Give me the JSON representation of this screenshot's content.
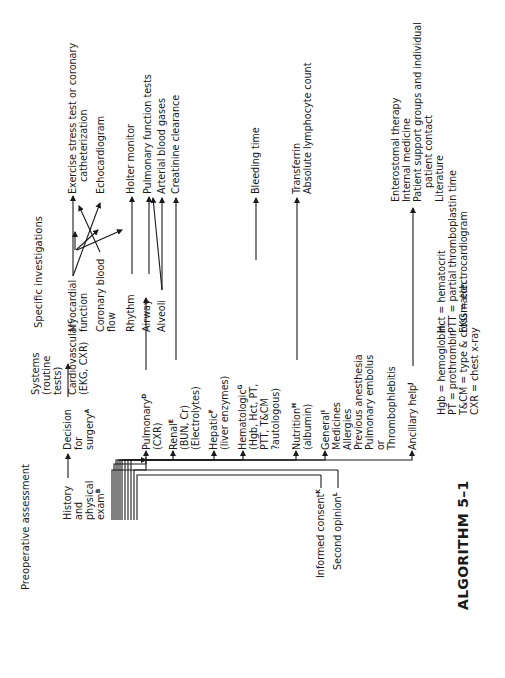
{
  "headers": {
    "preoperative": "Preoperative assessment",
    "systems": [
      "Systems",
      "(routine",
      "tests)"
    ],
    "specific": "Specific investigations"
  },
  "nodes": {
    "decision": [
      "Decision",
      "for",
      "surgery"
    ],
    "decision_sup": "A",
    "history": [
      "History",
      "and",
      "physical",
      "exam"
    ],
    "history_sup": "B",
    "cardiovascular": "Cardiovascular",
    "cardiovascular_sup": "C",
    "cardiovascular_sub": "(EKG, CXR)",
    "pulmonary": "Pulmonary",
    "pulmonary_sup": "D",
    "pulmonary_sub": "(CXR)",
    "renal": "Renal",
    "renal_sup": "E",
    "renal_sub": [
      "(BUN, Cr)",
      "(Electrolytes)"
    ],
    "hepatic": "Hepatic",
    "hepatic_sup": "F",
    "hepatic_sub": "(liver enzymes)",
    "hematologic": "Hematologic",
    "hematologic_sup": "G",
    "hematologic_sub": [
      "(Hgb, Hct, PT,",
      "PTT, T&CM",
      "?autologous)"
    ],
    "nutrition": "Nutrition",
    "nutrition_sup": "H",
    "nutrition_sub": "(albumin)",
    "general": "General",
    "general_sup": "I",
    "general_sub": [
      "Medicines",
      "Allergies",
      "Previous anesthesia",
      "Pulmonary embolus",
      "or",
      "Thrombophlebitis"
    ],
    "ancillary": "Ancillary help",
    "ancillary_sup": "J",
    "informed": "Informed consent",
    "informed_sup": "K",
    "second": "Second opinion",
    "second_sup": "L"
  },
  "cardio_branches": {
    "myocardial": [
      "Myocardial",
      "function"
    ],
    "coronary": [
      "Coronary blood",
      "flow"
    ],
    "rhythm": "Rhythm"
  },
  "pulm_branches": {
    "airway": "Airway",
    "alveoli": "Alveoli"
  },
  "investigations": {
    "exercise": [
      "Exercise stress test or coronary",
      "catheterization"
    ],
    "echo": "Echocardiogram",
    "holter": "Holter monitor",
    "pft": "Pulmonary function tests",
    "abg": "Arterial blood gases",
    "creatinine": "Creatinine clearance",
    "bleeding": "Bleeding time",
    "nutrition": [
      "Transferrin",
      "Absolute lymphocyte count"
    ],
    "ancillary": [
      "Enterostomal therapy",
      "Internal medicine",
      "Patient support groups and individual",
      "patient contact",
      "Literature"
    ]
  },
  "legend": {
    "left": [
      "Hgb = hemoglobin",
      "PT = prothrombin",
      "T&CM = type & crossmatch",
      "CXR = chest x-ray"
    ],
    "right": [
      "Hct = hematocrit",
      "PTT = partial thromboplastin time",
      "EKG = electrocardiogram"
    ]
  },
  "title": "ALGORITHM 5–1"
}
